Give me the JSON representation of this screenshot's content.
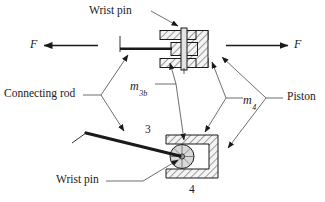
{
  "figure": {
    "background_color": "#ffffff",
    "line_color": "#1a1a1a",
    "hatch_fill_color": "#f2f2f2",
    "pin_fill_color": "#d9d9d9"
  },
  "labels": {
    "wrist_pin_top": "Wrist pin",
    "wrist_pin_bottom": "Wrist pin",
    "connecting_rod": "Connecting rod",
    "piston": "Piston",
    "force_left": "F",
    "force_right": "F",
    "mass_3b_symbol": "m",
    "mass_3b_subscript": "3b",
    "mass_4_symbol": "m",
    "mass_4_subscript": "4",
    "link_number_3": "3",
    "link_number_4": "4"
  }
}
